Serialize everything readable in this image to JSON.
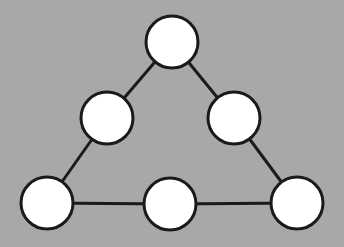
{
  "diagram": {
    "type": "graph",
    "background_color": "#a8a8a8",
    "node_fill": "#ffffff",
    "stroke_color": "#1a1a1a",
    "node_radius": 26,
    "nodes": [
      {
        "id": "top",
        "x": 172,
        "y": 42
      },
      {
        "id": "mid-left",
        "x": 107,
        "y": 118
      },
      {
        "id": "mid-right",
        "x": 234,
        "y": 118
      },
      {
        "id": "bottom-left",
        "x": 47,
        "y": 203
      },
      {
        "id": "bottom-middle",
        "x": 170,
        "y": 204
      },
      {
        "id": "bottom-right",
        "x": 297,
        "y": 203
      }
    ],
    "edges": [
      [
        "top",
        "mid-left"
      ],
      [
        "mid-left",
        "bottom-left"
      ],
      [
        "top",
        "mid-right"
      ],
      [
        "mid-right",
        "bottom-right"
      ],
      [
        "bottom-left",
        "bottom-middle"
      ],
      [
        "bottom-middle",
        "bottom-right"
      ]
    ]
  }
}
